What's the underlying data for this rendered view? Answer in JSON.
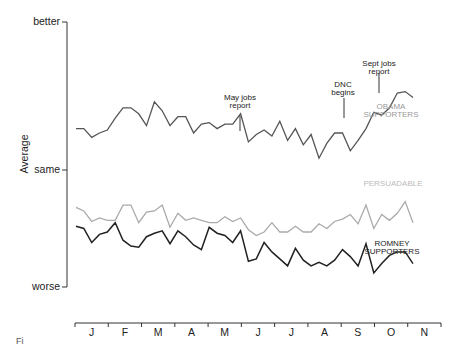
{
  "chart_data": {
    "type": "line",
    "title": "",
    "xlabel": "",
    "ylabel": "Average",
    "y_tick_labels": [
      "better",
      "same",
      "worse"
    ],
    "x_tick_labels": [
      "J",
      "F",
      "M",
      "A",
      "M",
      "J",
      "J",
      "A",
      "S",
      "O",
      "N"
    ],
    "ylim": [
      -1,
      1
    ],
    "grid": false,
    "legend": "inline labels",
    "x": [
      0,
      1,
      2,
      3,
      4,
      5,
      6,
      7,
      8,
      9,
      10,
      11,
      12,
      13,
      14,
      15,
      16,
      17,
      18,
      19,
      20,
      21,
      22,
      23,
      24,
      25,
      26,
      27,
      28,
      29,
      30,
      31,
      32,
      33,
      34,
      35,
      36,
      37,
      38,
      39,
      40,
      41,
      42,
      43
    ],
    "series": [
      {
        "name": "OBAMA SUPPORTERS",
        "color": "#555555",
        "values": [
          0.28,
          0.28,
          0.22,
          0.25,
          0.27,
          0.35,
          0.42,
          0.42,
          0.38,
          0.3,
          0.46,
          0.4,
          0.3,
          0.36,
          0.36,
          0.25,
          0.31,
          0.32,
          0.28,
          0.31,
          0.31,
          0.38,
          0.19,
          0.24,
          0.27,
          0.23,
          0.33,
          0.2,
          0.28,
          0.17,
          0.24,
          0.08,
          0.18,
          0.25,
          0.25,
          0.13,
          0.2,
          0.28,
          0.39,
          0.37,
          0.42,
          0.52,
          0.53,
          0.49
        ]
      },
      {
        "name": "PERSUADABLE",
        "color": "#aaaaaa",
        "values": [
          -0.32,
          -0.35,
          -0.44,
          -0.41,
          -0.43,
          -0.43,
          -0.3,
          -0.3,
          -0.45,
          -0.36,
          -0.35,
          -0.3,
          -0.49,
          -0.37,
          -0.43,
          -0.41,
          -0.43,
          -0.45,
          -0.45,
          -0.4,
          -0.44,
          -0.41,
          -0.51,
          -0.56,
          -0.53,
          -0.45,
          -0.53,
          -0.53,
          -0.48,
          -0.53,
          -0.53,
          -0.46,
          -0.5,
          -0.44,
          -0.42,
          -0.38,
          -0.46,
          -0.3,
          -0.5,
          -0.38,
          -0.43,
          -0.37,
          -0.27,
          -0.45
        ]
      },
      {
        "name": "ROMNEY SUPPORTERS",
        "color": "#222222",
        "values": [
          -0.48,
          -0.5,
          -0.62,
          -0.55,
          -0.53,
          -0.45,
          -0.6,
          -0.65,
          -0.66,
          -0.57,
          -0.54,
          -0.52,
          -0.63,
          -0.52,
          -0.57,
          -0.64,
          -0.68,
          -0.49,
          -0.54,
          -0.56,
          -0.62,
          -0.52,
          -0.78,
          -0.76,
          -0.62,
          -0.7,
          -0.76,
          -0.82,
          -0.67,
          -0.77,
          -0.82,
          -0.79,
          -0.82,
          -0.77,
          -0.68,
          -0.74,
          -0.82,
          -0.63,
          -0.88,
          -0.8,
          -0.73,
          -0.7,
          -0.7,
          -0.8
        ]
      }
    ],
    "annotations": [
      {
        "text": "May jobs report",
        "x_index": 21
      },
      {
        "text": "DNC begins",
        "x_index": 36
      },
      {
        "text": "Sept jobs report",
        "x_index": 40
      }
    ]
  },
  "axes": {
    "ylabel": "Average",
    "yticks": [
      "better",
      "same",
      "worse"
    ],
    "months": [
      "J",
      "F",
      "M",
      "A",
      "M",
      "J",
      "J",
      "A",
      "S",
      "O",
      "N"
    ]
  },
  "labels": {
    "obama_1": "OBAMA",
    "obama_2": "SUPPORTERS",
    "persuadable": "PERSUADABLE",
    "romney_1": "ROMNEY",
    "romney_2": "SUPPORTERS",
    "may_1": "May jobs",
    "may_2": "report",
    "dnc_1": "DNC",
    "dnc_2": "begins",
    "sept_1": "Sept jobs",
    "sept_2": "report"
  },
  "caption": "Fi"
}
